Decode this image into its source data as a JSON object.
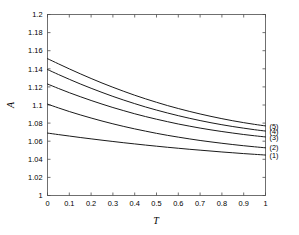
{
  "chart_data": {
    "type": "line",
    "title": "",
    "xlabel": "T",
    "ylabel": "A",
    "xlim": [
      0,
      1
    ],
    "ylim": [
      1,
      1.2
    ],
    "grid": false,
    "legend_position": "right-outside-curve-labels",
    "xticks": [
      0,
      0.1,
      0.2,
      0.3,
      0.4,
      0.5,
      0.6,
      0.7,
      0.8,
      0.9,
      1
    ],
    "xticklabels": [
      "0",
      "0.1",
      "0.2",
      "0.3",
      "0.4",
      "0.5",
      "0.6",
      "0.7",
      "0.8",
      "0.9",
      "1"
    ],
    "yticks": [
      1,
      1.02,
      1.04,
      1.06,
      1.08,
      1.1,
      1.12,
      1.14,
      1.16,
      1.18,
      1.2
    ],
    "yticklabels": [
      "1",
      "1.02",
      "1.04",
      "1.06",
      "1.08",
      "1.1",
      "1.12",
      "1.14",
      "1.16",
      "1.18",
      "1.2"
    ],
    "x": [
      0,
      0.05,
      0.1,
      0.15,
      0.2,
      0.25,
      0.3,
      0.35,
      0.4,
      0.45,
      0.5,
      0.55,
      0.6,
      0.65,
      0.7,
      0.75,
      0.8,
      0.85,
      0.9,
      0.95,
      1
    ],
    "series": [
      {
        "name": "(1)",
        "label": "(1)",
        "color": "#1a1a1a",
        "values": [
          1.069,
          1.0673,
          1.0657,
          1.0641,
          1.0626,
          1.0611,
          1.0597,
          1.0583,
          1.057,
          1.0557,
          1.0545,
          1.0533,
          1.0522,
          1.0511,
          1.0501,
          1.0491,
          1.0481,
          1.0472,
          1.0463,
          1.0455,
          1.0447
        ]
      },
      {
        "name": "(2)",
        "label": "(2)",
        "color": "#1a1a1a",
        "values": [
          1.101,
          1.0968,
          1.0928,
          1.0891,
          1.0856,
          1.0823,
          1.0792,
          1.0763,
          1.0736,
          1.0711,
          1.0687,
          1.0665,
          1.0645,
          1.0626,
          1.0608,
          1.0592,
          1.0577,
          1.0563,
          1.055,
          1.0538,
          1.0527
        ]
      },
      {
        "name": "(3)",
        "label": "(3)",
        "color": "#1a1a1a",
        "values": [
          1.1232,
          1.1183,
          1.1136,
          1.1092,
          1.105,
          1.101,
          1.0972,
          1.0937,
          1.0903,
          1.0872,
          1.0843,
          1.0816,
          1.079,
          1.0767,
          1.0745,
          1.0725,
          1.0707,
          1.069,
          1.0674,
          1.066,
          1.0647
        ]
      },
      {
        "name": "(4)",
        "label": "(4)",
        "color": "#1a1a1a",
        "values": [
          1.1392,
          1.1337,
          1.1284,
          1.1233,
          1.1185,
          1.1139,
          1.1095,
          1.1054,
          1.1015,
          1.0978,
          1.0944,
          1.0912,
          1.0882,
          1.0854,
          1.0828,
          1.0804,
          1.0782,
          1.0762,
          1.0744,
          1.0727,
          1.0712
        ]
      },
      {
        "name": "(5)",
        "label": "(5)",
        "color": "#1a1a1a",
        "values": [
          1.1512,
          1.1455,
          1.1399,
          1.1345,
          1.1293,
          1.1243,
          1.1196,
          1.1151,
          1.1108,
          1.1068,
          1.103,
          1.0994,
          1.0961,
          1.093,
          1.0901,
          1.0874,
          1.0849,
          1.0826,
          1.0805,
          1.0786,
          1.0769
        ]
      }
    ]
  }
}
